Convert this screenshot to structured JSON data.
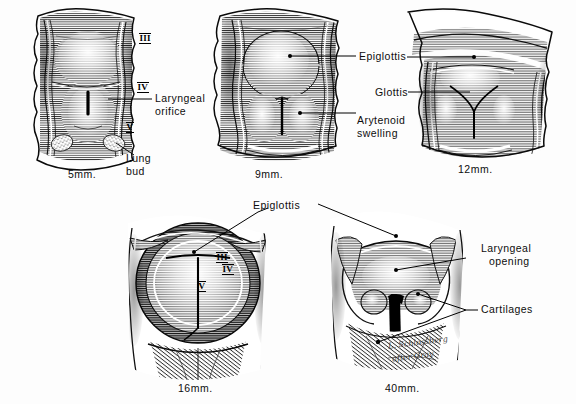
{
  "figure": {
    "medium": "pen-and-ink stipple and line hatching",
    "background_color": "#fdfdfd",
    "ink_color": "#111111",
    "panel_count": 5
  },
  "panels": [
    {
      "id": "panel-5mm",
      "caption": "5mm.",
      "labels": [
        {
          "name": "laryngeal-orifice",
          "text": "Laryngeal\norifice"
        },
        {
          "name": "lung-bud",
          "text": "Lung\nbud"
        }
      ],
      "arch_numerals": [
        "III",
        "IV",
        "V"
      ]
    },
    {
      "id": "panel-9mm",
      "caption": "9mm.",
      "labels": [
        {
          "name": "epiglottis",
          "text": "Epiglottis"
        },
        {
          "name": "arytenoid-swelling",
          "text": "Arytenoid\nswelling"
        }
      ],
      "arch_numerals": []
    },
    {
      "id": "panel-12mm",
      "caption": "12mm.",
      "labels": [
        {
          "name": "glottis",
          "text": "Glottis"
        }
      ],
      "arch_numerals": []
    },
    {
      "id": "panel-16mm",
      "caption": "16mm.",
      "labels": [
        {
          "name": "epiglottis",
          "text": "Epiglottis"
        }
      ],
      "arch_numerals": [
        "III",
        "IV",
        "V"
      ]
    },
    {
      "id": "panel-40mm",
      "caption": "40mm.",
      "labels": [
        {
          "name": "laryngeal-opening",
          "text": "Laryngeal\nopening"
        },
        {
          "name": "cartilages",
          "text": "Cartilages"
        }
      ],
      "arch_numerals": []
    }
  ],
  "captions": {
    "c5": "5mm.",
    "c9": "9mm.",
    "c12": "12mm.",
    "c16": "16mm.",
    "c40": "40mm."
  },
  "labels": {
    "laryngeal_orifice_l1": "Laryngeal",
    "laryngeal_orifice_l2": "orifice",
    "lung_bud_l1": "Lung",
    "lung_bud_l2": "bud",
    "epiglottis_top": "Epiglottis",
    "glottis": "Glottis",
    "arytenoid_l1": "Arytenoid",
    "arytenoid_l2": "swelling",
    "epiglottis_bottom": "Epiglottis",
    "laryngeal_opening_l1": "Laryngeal",
    "laryngeal_opening_l2": "opening",
    "cartilages": "Cartilages"
  },
  "numerals": {
    "p1_iii": "III",
    "p1_iv": "IV",
    "p1_v": "V",
    "p4_iii": "III",
    "p4_iv": "IV",
    "p4_v": "V"
  },
  "signature": {
    "artist_line": "L. Schlossberg",
    "credit_line": "after Gray"
  }
}
